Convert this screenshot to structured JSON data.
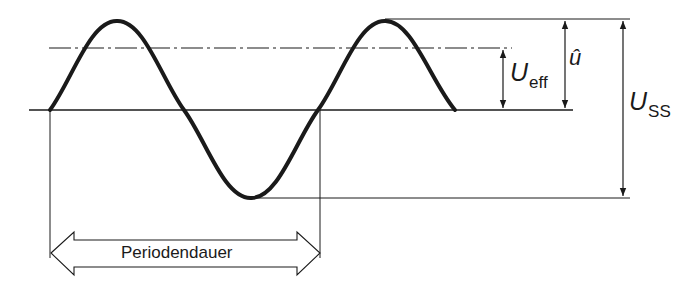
{
  "diagram": {
    "type": "sine-wave-parameters",
    "colors": {
      "stroke": "#1a1a1a",
      "background": "#ffffff"
    },
    "labels": {
      "u_eff_main": "U",
      "u_eff_sub": "eff",
      "u_hat": "û",
      "u_ss_main": "U",
      "u_ss_sub": "SS",
      "period": "Periodendauer"
    },
    "elements": [
      {
        "id": "sine-curve",
        "description": "1.5 periods of sine wave, thick stroke"
      },
      {
        "id": "zero-line",
        "description": "horizontal baseline"
      },
      {
        "id": "rms-line",
        "description": "dash-dot line at effective value level"
      },
      {
        "id": "peak-line",
        "description": "thin horizontal reference at peak"
      },
      {
        "id": "trough-line",
        "description": "thin horizontal reference at trough"
      },
      {
        "id": "u-eff-arrow",
        "description": "double-headed arrow baseline to rms level"
      },
      {
        "id": "u-hat-arrow",
        "description": "double-headed arrow baseline to peak"
      },
      {
        "id": "u-ss-arrow",
        "description": "double-headed arrow trough to peak"
      },
      {
        "id": "period-arrow",
        "description": "hollow double arrow spanning one period"
      }
    ]
  }
}
